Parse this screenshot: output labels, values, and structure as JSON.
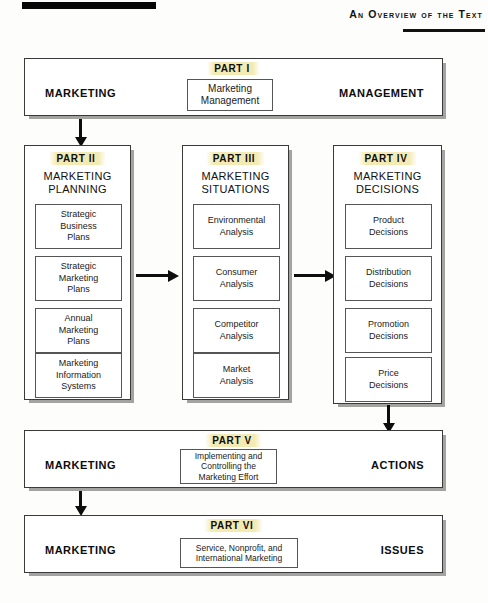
{
  "header": {
    "title": "An Overview of the Text"
  },
  "diagram": {
    "part1": {
      "part_label": "PART I",
      "left_label": "MARKETING",
      "right_label": "MANAGEMENT",
      "center_box": "Marketing\nManagement"
    },
    "columns": [
      {
        "part_label": "PART II",
        "title": "MARKETING\nPLANNING",
        "items": [
          "Strategic\nBusiness\nPlans",
          "Strategic\nMarketing\nPlans",
          "Annual\nMarketing\nPlans",
          "Marketing\nInformation\nSystems"
        ]
      },
      {
        "part_label": "PART III",
        "title": "MARKETING\nSITUATIONS",
        "items": [
          "Environmental\nAnalysis",
          "Consumer\nAnalysis",
          "Competitor\nAnalysis",
          "Market\nAnalysis"
        ]
      },
      {
        "part_label": "PART IV",
        "title": "MARKETING\nDECISIONS",
        "items": [
          "Product\nDecisions",
          "Distribution\nDecisions",
          "Promotion\nDecisions",
          "Price\nDecisions"
        ]
      }
    ],
    "part5": {
      "part_label": "PART V",
      "left_label": "MARKETING",
      "right_label": "ACTIONS",
      "center_box": "Implementing and\nControlling the\nMarketing Effort"
    },
    "part6": {
      "part_label": "PART VI",
      "left_label": "MARKETING",
      "right_label": "ISSUES",
      "center_box": "Service, Nonprofit, and\nInternational Marketing"
    }
  },
  "colors": {
    "highlight": "#f3e9af",
    "rule": "#060606",
    "box_border": "#3a3a3a"
  }
}
